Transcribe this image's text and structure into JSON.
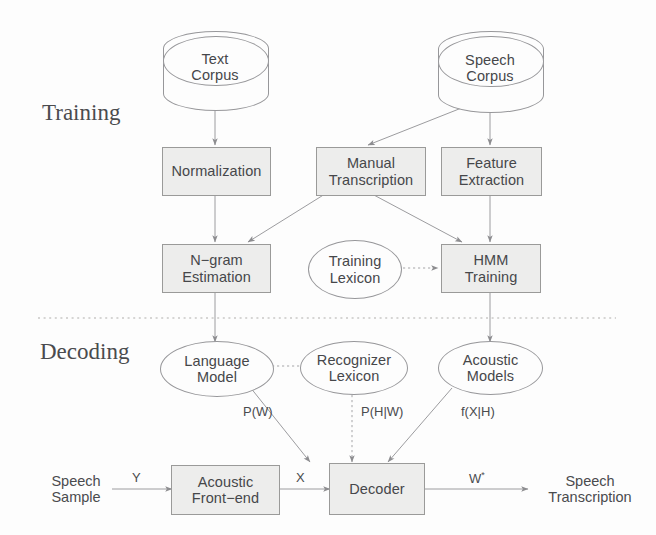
{
  "figure": {
    "background": "#fdfdfd",
    "stroke_color": "#97979a",
    "box_fill": "#ededec",
    "text_color": "#46474a"
  },
  "sections": {
    "training_label": "Training",
    "decoding_label": "Decoding",
    "divider": "dotted-horizontal-rule"
  },
  "nodes": {
    "text_corpus": {
      "label": "Text\nCorpus",
      "shape": "cylinder"
    },
    "speech_corpus": {
      "label": "Speech\nCorpus",
      "shape": "cylinder"
    },
    "normalization": {
      "label": "Normalization",
      "shape": "box"
    },
    "manual_transcription": {
      "label": "Manual\nTranscription",
      "shape": "box"
    },
    "feature_extraction": {
      "label": "Feature\nExtraction",
      "shape": "box"
    },
    "ngram_estimation": {
      "label": "N−gram\nEstimation",
      "shape": "box"
    },
    "training_lexicon": {
      "label": "Training\nLexicon",
      "shape": "ellipse"
    },
    "hmm_training": {
      "label": "HMM\nTraining",
      "shape": "box"
    },
    "language_model": {
      "label": "Language\nModel",
      "shape": "ellipse"
    },
    "recognizer_lexicon": {
      "label": "Recognizer\nLexicon",
      "shape": "ellipse"
    },
    "acoustic_models": {
      "label": "Acoustic\nModels",
      "shape": "ellipse"
    },
    "acoustic_frontend": {
      "label": "Acoustic\nFront−end",
      "shape": "box"
    },
    "decoder": {
      "label": "Decoder",
      "shape": "box"
    },
    "speech_sample": {
      "label": "Speech\nSample",
      "shape": "text"
    },
    "speech_transcription": {
      "label": "Speech\nTranscription",
      "shape": "text"
    }
  },
  "edge_labels": {
    "p_w": "P(W)",
    "p_h_given_w": "P(H|W)",
    "f_x_given_h": "f(X|H)",
    "signal_y": "Y",
    "features_x": "X",
    "output_w": "W",
    "output_w_sup": "*"
  },
  "edges": [
    {
      "from": "text_corpus",
      "to": "normalization",
      "style": "solid"
    },
    {
      "from": "speech_corpus",
      "to": "manual_transcription",
      "style": "solid"
    },
    {
      "from": "speech_corpus",
      "to": "feature_extraction",
      "style": "solid"
    },
    {
      "from": "normalization",
      "to": "ngram_estimation",
      "style": "solid"
    },
    {
      "from": "manual_transcription",
      "to": "ngram_estimation",
      "style": "solid"
    },
    {
      "from": "manual_transcription",
      "to": "hmm_training",
      "style": "solid"
    },
    {
      "from": "feature_extraction",
      "to": "hmm_training",
      "style": "solid"
    },
    {
      "from": "training_lexicon",
      "to": "hmm_training",
      "style": "dotted"
    },
    {
      "from": "ngram_estimation",
      "to": "language_model",
      "style": "solid"
    },
    {
      "from": "hmm_training",
      "to": "acoustic_models",
      "style": "solid"
    },
    {
      "from": "language_model",
      "to": "recognizer_lexicon",
      "style": "dotted"
    },
    {
      "from": "language_model",
      "to": "decoder",
      "style": "solid",
      "label": "P(W)"
    },
    {
      "from": "recognizer_lexicon",
      "to": "decoder",
      "style": "dotted",
      "label": "P(H|W)"
    },
    {
      "from": "acoustic_models",
      "to": "decoder",
      "style": "solid",
      "label": "f(X|H)"
    },
    {
      "from": "speech_sample",
      "to": "acoustic_frontend",
      "style": "solid",
      "label": "Y"
    },
    {
      "from": "acoustic_frontend",
      "to": "decoder",
      "style": "solid",
      "label": "X"
    },
    {
      "from": "decoder",
      "to": "speech_transcription",
      "style": "solid",
      "label": "W*"
    }
  ]
}
